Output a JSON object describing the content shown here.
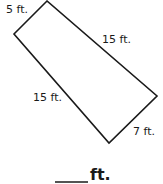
{
  "diagram": {
    "shape": "quadrilateral",
    "stroke_color": "#1a1a1a",
    "vertices": {
      "top": [
        47,
        1
      ],
      "left": [
        14,
        34
      ],
      "bottom": [
        109,
        143
      ],
      "right": [
        157,
        96
      ]
    },
    "sides": [
      {
        "id": "top-left",
        "label": "5 ft."
      },
      {
        "id": "top-right",
        "label": "15 ft."
      },
      {
        "id": "left-bottom",
        "label": "15 ft."
      },
      {
        "id": "bottom-right",
        "label": "7 ft."
      }
    ]
  },
  "answer": {
    "blank": "",
    "unit": "ft."
  }
}
